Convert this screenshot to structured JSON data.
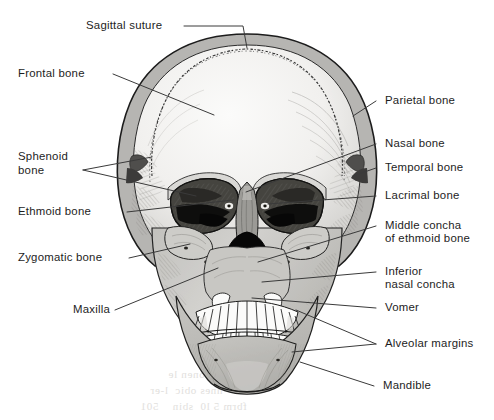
{
  "figure": {
    "view": "anterior",
    "style": "grayscale line-and-tone anatomical illustration"
  },
  "labels": {
    "sagittal_suture": "Sagittal suture",
    "frontal_bone": "Frontal bone",
    "sphenoid_bone_line1": "Sphenoid",
    "sphenoid_bone_line2": "bone",
    "ethmoid_bone": "Ethmoid bone",
    "zygomatic_bone": "Zygomatic bone",
    "maxilla": "Maxilla",
    "parietal_bone": "Parietal bone",
    "nasal_bone": "Nasal bone",
    "temporal_bone": "Temporal bone",
    "lacrimal_bone": "Lacrimal bone",
    "middle_concha_line1": "Middle concha",
    "middle_concha_line2": "of ethmoid bone",
    "inferior_nasal_concha_line1": "Inferior",
    "inferior_nasal_concha_line2": "nasal concha",
    "vomer": "Vomer",
    "alveolar_margins": "Alveolar margins",
    "mandible": "Mandible"
  },
  "colors": {
    "background": "#ffffff",
    "ink": "#1d1d1d",
    "leader_line": "#3a3a3a",
    "cranium_fill": "#f2f1ef",
    "cranium_rim": "#b3b2b0",
    "face_fill": "#c9c8c5",
    "mandible_fill": "#bcbbb8",
    "orbit_shadow": "#4a4a4a",
    "orbit_deep": "#0d0d0d",
    "nasal_cavity": "#0a0a0a",
    "teeth": "#fbfbfa",
    "hatching": "#6e6d6b",
    "ghost_text": "#c9c6c2"
  },
  "ghost_text": [
    "onen le",
    "nnes obic  l-er",
    "fbrm 5 l0  sbin    501"
  ]
}
